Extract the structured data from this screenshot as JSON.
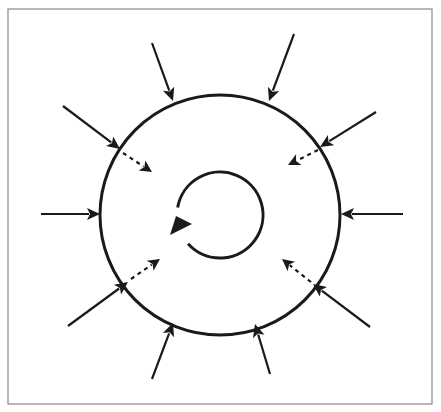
{
  "diagram": {
    "title": "",
    "frame": {
      "x": 8,
      "y": 9,
      "width": 424,
      "height": 395,
      "stroke": "#8a8a8a"
    },
    "colors": {
      "line": "#1a1a1a",
      "background": "#ffffff"
    },
    "outer_circle": {
      "cx": 220,
      "cy": 215,
      "r": 120
    },
    "rotation_arrow": {
      "cx": 220,
      "cy": 215,
      "r": 43,
      "direction": "clockwise"
    },
    "external_arrows": [
      {
        "id": "top-left",
        "x1": 152,
        "y1": 43,
        "x2": 173,
        "y2": 101
      },
      {
        "id": "top-right",
        "x1": 294,
        "y1": 34,
        "x2": 269,
        "y2": 101
      },
      {
        "id": "upper-left",
        "x1": 63,
        "y1": 106,
        "x2": 120,
        "y2": 149
      },
      {
        "id": "upper-right",
        "x1": 376,
        "y1": 112,
        "x2": 320,
        "y2": 147
      },
      {
        "id": "left",
        "x1": 41,
        "y1": 214,
        "x2": 100,
        "y2": 214
      },
      {
        "id": "right",
        "x1": 403,
        "y1": 214,
        "x2": 341,
        "y2": 214
      },
      {
        "id": "lower-left",
        "x1": 68,
        "y1": 326,
        "x2": 128,
        "y2": 282
      },
      {
        "id": "lower-right",
        "x1": 370,
        "y1": 327,
        "x2": 313,
        "y2": 284
      },
      {
        "id": "bottom-left",
        "x1": 152,
        "y1": 379,
        "x2": 173,
        "y2": 323
      },
      {
        "id": "bottom-right",
        "x1": 270,
        "y1": 374,
        "x2": 255,
        "y2": 324
      }
    ],
    "internal_dashed_arrows": [
      {
        "id": "in-upper-left",
        "x1": 123,
        "y1": 153,
        "x2": 152,
        "y2": 172
      },
      {
        "id": "in-upper-right",
        "x1": 318,
        "y1": 150,
        "x2": 288,
        "y2": 165
      },
      {
        "id": "in-lower-left",
        "x1": 131,
        "y1": 279,
        "x2": 160,
        "y2": 259
      },
      {
        "id": "in-lower-right",
        "x1": 311,
        "y1": 282,
        "x2": 282,
        "y2": 259
      }
    ]
  }
}
